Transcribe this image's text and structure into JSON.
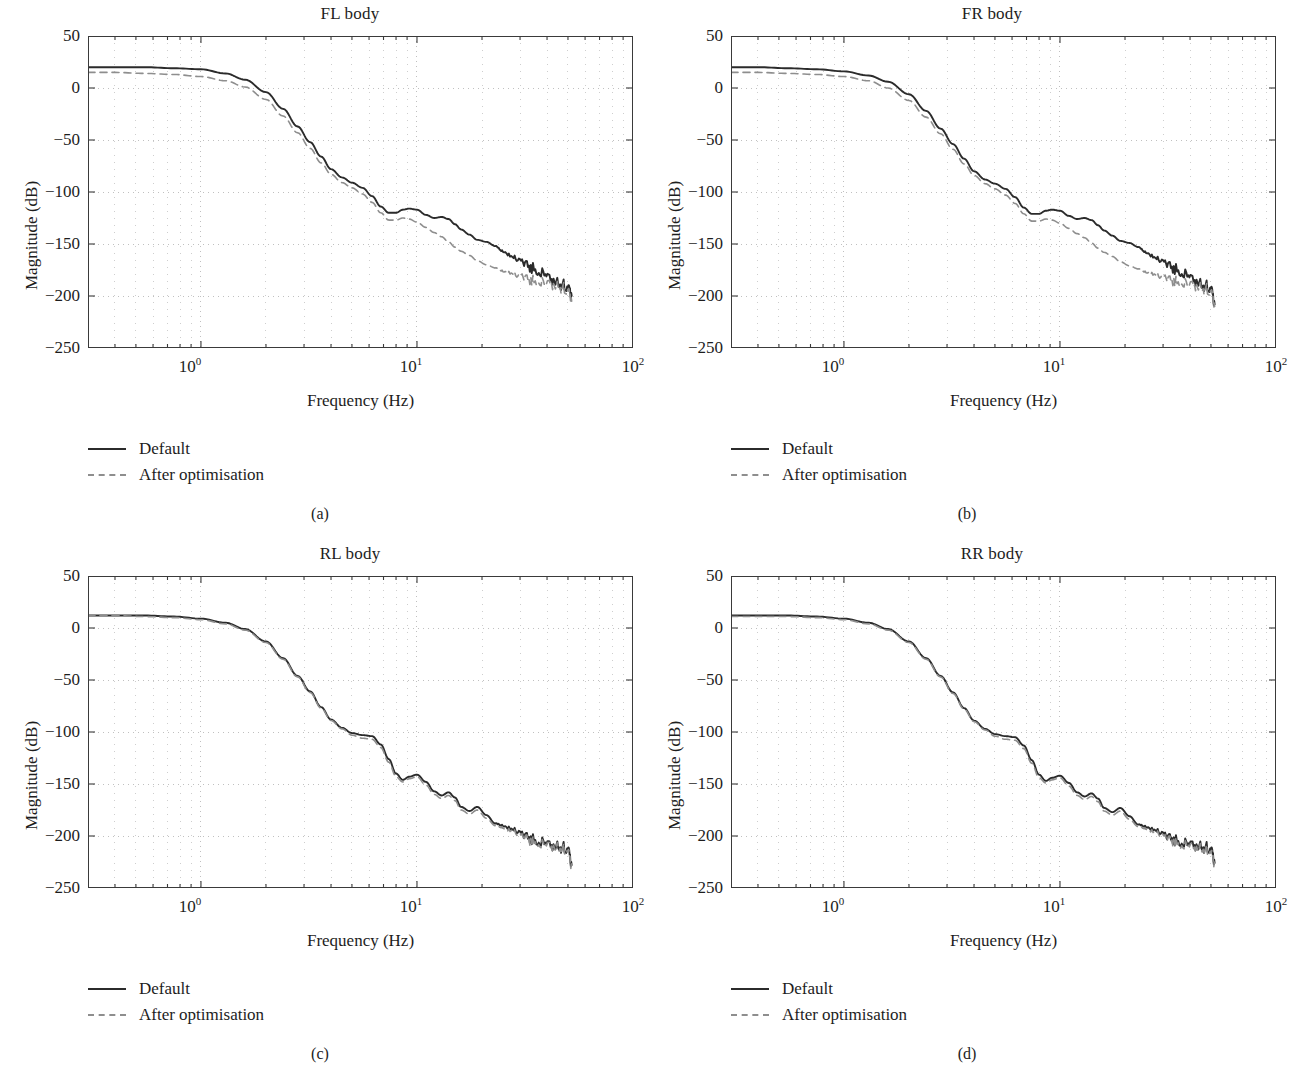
{
  "figure": {
    "panels": [
      {
        "id": "fl",
        "title": "FL body",
        "caption": "(a)",
        "xlabel": "Frequency (Hz)",
        "ylabel": "Magnitude (dB)",
        "legend": [
          {
            "label": "Default",
            "style": "solid"
          },
          {
            "label": "After optimisation",
            "style": "dashed"
          }
        ]
      },
      {
        "id": "fr",
        "title": "FR body",
        "caption": "(b)",
        "xlabel": "Frequency (Hz)",
        "ylabel": "Magnitude (dB)",
        "legend": [
          {
            "label": "Default",
            "style": "solid"
          },
          {
            "label": "After optimisation",
            "style": "dashed"
          }
        ]
      },
      {
        "id": "rl",
        "title": "RL body",
        "caption": "(c)",
        "xlabel": "Frequency (Hz)",
        "ylabel": "Magnitude (dB)",
        "legend": [
          {
            "label": "Default",
            "style": "solid"
          },
          {
            "label": "After optimisation",
            "style": "dashed"
          }
        ]
      },
      {
        "id": "rr",
        "title": "RR body",
        "caption": "(d)",
        "xlabel": "Frequency (Hz)",
        "ylabel": "Magnitude (dB)",
        "legend": [
          {
            "label": "Default",
            "style": "solid"
          },
          {
            "label": "After optimisation",
            "style": "dashed"
          }
        ]
      }
    ],
    "yticks": [
      "50",
      "0",
      "−100",
      "−150",
      "−200",
      "−250",
      "−50"
    ],
    "ytick_labels": [
      "50",
      "0",
      "−50",
      "−100",
      "−150",
      "−200",
      "−250"
    ],
    "xtick_bases": [
      "10",
      "10",
      "10"
    ],
    "xtick_exps": [
      "0",
      "1",
      "2"
    ],
    "colors": {
      "default_line": "#2b2b2b",
      "optimised_line": "#8e8e8e",
      "axis": "#3a3a3a",
      "grid": "#b9b9b9",
      "text": "#1d1d1d"
    }
  },
  "chart_data": [
    {
      "type": "line",
      "title": "FL body",
      "subcaption": "(a)",
      "xlabel": "Frequency (Hz)",
      "ylabel": "Magnitude (dB)",
      "xscale": "log",
      "xlim": [
        0.3,
        100
      ],
      "ylim": [
        -250,
        50
      ],
      "yticks": [
        50,
        0,
        -50,
        -100,
        -150,
        -200,
        -250
      ],
      "xticks": [
        1,
        10,
        100
      ],
      "xtick_labels": [
        "10^0",
        "10^1",
        "10^2"
      ],
      "grid": true,
      "legend": [
        "Default",
        "After optimisation"
      ],
      "legend_position": "below-left",
      "series": [
        {
          "name": "Default",
          "style": "solid",
          "color": "#2b2b2b",
          "x": [
            0.3,
            0.4,
            0.55,
            0.75,
            1.0,
            1.3,
            1.6,
            2.0,
            2.4,
            2.8,
            3.2,
            3.6,
            4.0,
            4.5,
            5.0,
            5.6,
            6.2,
            6.8,
            7.4,
            8.0,
            8.6,
            9.2,
            10.0,
            11.0,
            12.0,
            13.0,
            14.0,
            15.0,
            16.0,
            17.5,
            19.0,
            21.0,
            23.0,
            25.0,
            28.0,
            31.0,
            34.0,
            38.0,
            42.0,
            46.0,
            50.0,
            52.0
          ],
          "y": [
            20,
            20,
            20,
            19,
            18,
            14,
            8,
            -4,
            -20,
            -37,
            -52,
            -66,
            -78,
            -86,
            -91,
            -96,
            -104,
            -114,
            -120,
            -120,
            -117,
            -116,
            -117,
            -122,
            -125,
            -124,
            -126,
            -131,
            -136,
            -141,
            -146,
            -148,
            -152,
            -157,
            -163,
            -168,
            -173,
            -179,
            -185,
            -189,
            -191,
            -200
          ]
        },
        {
          "name": "After optimisation",
          "style": "dashed",
          "color": "#8e8e8e",
          "x": [
            0.3,
            0.4,
            0.55,
            0.75,
            1.0,
            1.3,
            1.6,
            2.0,
            2.4,
            2.8,
            3.2,
            3.6,
            4.0,
            4.5,
            5.0,
            5.6,
            6.2,
            6.8,
            7.4,
            8.0,
            8.6,
            9.2,
            10.0,
            11.0,
            12.0,
            13.0,
            14.0,
            15.0,
            16.0,
            17.5,
            19.0,
            21.0,
            23.0,
            25.0,
            28.0,
            31.0,
            34.0,
            38.0,
            42.0,
            46.0,
            50.0,
            52.0
          ],
          "y": [
            15,
            15,
            14,
            13,
            11,
            7,
            1,
            -11,
            -27,
            -43,
            -58,
            -72,
            -83,
            -91,
            -96,
            -102,
            -110,
            -120,
            -127,
            -127,
            -125,
            -126,
            -129,
            -134,
            -139,
            -143,
            -148,
            -153,
            -157,
            -161,
            -166,
            -170,
            -173,
            -176,
            -179,
            -182,
            -185,
            -188,
            -190,
            -192,
            -194,
            -205
          ]
        }
      ]
    },
    {
      "type": "line",
      "title": "FR body",
      "subcaption": "(b)",
      "xlabel": "Frequency (Hz)",
      "ylabel": "Magnitude (dB)",
      "xscale": "log",
      "xlim": [
        0.3,
        100
      ],
      "ylim": [
        -250,
        50
      ],
      "yticks": [
        50,
        0,
        -50,
        -100,
        -150,
        -200,
        -250
      ],
      "xticks": [
        1,
        10,
        100
      ],
      "xtick_labels": [
        "10^0",
        "10^1",
        "10^2"
      ],
      "grid": true,
      "legend": [
        "Default",
        "After optimisation"
      ],
      "legend_position": "below-left",
      "series": [
        {
          "name": "Default",
          "style": "solid",
          "color": "#2b2b2b",
          "x": [
            0.3,
            0.4,
            0.55,
            0.75,
            1.0,
            1.3,
            1.6,
            2.0,
            2.4,
            2.8,
            3.2,
            3.6,
            4.0,
            4.5,
            5.0,
            5.6,
            6.2,
            6.8,
            7.4,
            8.0,
            8.6,
            9.2,
            10.0,
            11.0,
            12.0,
            13.0,
            14.0,
            15.0,
            16.0,
            17.5,
            19.0,
            21.0,
            23.0,
            25.0,
            28.0,
            31.0,
            34.0,
            38.0,
            42.0,
            46.0,
            50.0,
            52.0
          ],
          "y": [
            20,
            20,
            19,
            18,
            16,
            12,
            6,
            -6,
            -22,
            -39,
            -54,
            -68,
            -80,
            -88,
            -92,
            -97,
            -105,
            -115,
            -121,
            -121,
            -118,
            -117,
            -118,
            -123,
            -126,
            -125,
            -127,
            -132,
            -137,
            -142,
            -147,
            -149,
            -153,
            -158,
            -164,
            -169,
            -174,
            -180,
            -186,
            -190,
            -192,
            -208
          ]
        },
        {
          "name": "After optimisation",
          "style": "dashed",
          "color": "#8e8e8e",
          "x": [
            0.3,
            0.4,
            0.55,
            0.75,
            1.0,
            1.3,
            1.6,
            2.0,
            2.4,
            2.8,
            3.2,
            3.6,
            4.0,
            4.5,
            5.0,
            5.6,
            6.2,
            6.8,
            7.4,
            8.0,
            8.6,
            9.2,
            10.0,
            11.0,
            12.0,
            13.0,
            14.0,
            15.0,
            16.0,
            17.5,
            19.0,
            21.0,
            23.0,
            25.0,
            28.0,
            31.0,
            34.0,
            38.0,
            42.0,
            46.0,
            50.0,
            52.0
          ],
          "y": [
            15,
            15,
            14,
            13,
            11,
            7,
            0,
            -12,
            -28,
            -44,
            -59,
            -73,
            -84,
            -92,
            -97,
            -103,
            -111,
            -121,
            -128,
            -128,
            -126,
            -127,
            -130,
            -135,
            -140,
            -144,
            -149,
            -154,
            -158,
            -162,
            -167,
            -171,
            -174,
            -177,
            -180,
            -183,
            -186,
            -189,
            -191,
            -193,
            -195,
            -210
          ]
        }
      ]
    },
    {
      "type": "line",
      "title": "RL body",
      "subcaption": "(c)",
      "xlabel": "Frequency (Hz)",
      "ylabel": "Magnitude (dB)",
      "xscale": "log",
      "xlim": [
        0.3,
        100
      ],
      "ylim": [
        -250,
        50
      ],
      "yticks": [
        50,
        0,
        -50,
        -100,
        -150,
        -200,
        -250
      ],
      "xticks": [
        1,
        10,
        100
      ],
      "xtick_labels": [
        "10^0",
        "10^1",
        "10^2"
      ],
      "grid": true,
      "legend": [
        "Default",
        "After optimisation"
      ],
      "legend_position": "below-left",
      "series": [
        {
          "name": "Default",
          "style": "solid",
          "color": "#2b2b2b",
          "x": [
            0.3,
            0.4,
            0.55,
            0.75,
            1.0,
            1.3,
            1.6,
            2.0,
            2.4,
            2.8,
            3.2,
            3.6,
            4.0,
            4.5,
            5.0,
            5.6,
            6.2,
            6.8,
            7.4,
            8.0,
            8.6,
            9.2,
            10.0,
            11.0,
            12.0,
            13.0,
            14.0,
            15.0,
            16.0,
            17.5,
            19.0,
            21.0,
            23.0,
            25.0,
            28.0,
            31.0,
            34.0,
            38.0,
            42.0,
            46.0,
            50.0,
            52.0
          ],
          "y": [
            12,
            12,
            12,
            11,
            9,
            5,
            -1,
            -13,
            -29,
            -46,
            -61,
            -76,
            -88,
            -96,
            -101,
            -103,
            -104,
            -112,
            -126,
            -140,
            -146,
            -143,
            -141,
            -148,
            -157,
            -161,
            -158,
            -163,
            -172,
            -176,
            -172,
            -180,
            -188,
            -190,
            -194,
            -199,
            -203,
            -207,
            -210,
            -211,
            -212,
            -228
          ]
        },
        {
          "name": "After optimisation",
          "style": "dashed",
          "color": "#8e8e8e",
          "x": [
            0.3,
            0.4,
            0.55,
            0.75,
            1.0,
            1.3,
            1.6,
            2.0,
            2.4,
            2.8,
            3.2,
            3.6,
            4.0,
            4.5,
            5.0,
            5.6,
            6.2,
            6.8,
            7.4,
            8.0,
            8.6,
            9.2,
            10.0,
            11.0,
            12.0,
            13.0,
            14.0,
            15.0,
            16.0,
            17.5,
            19.0,
            21.0,
            23.0,
            25.0,
            28.0,
            31.0,
            34.0,
            38.0,
            42.0,
            46.0,
            50.0,
            52.0
          ],
          "y": [
            12,
            12,
            11,
            10,
            8,
            4,
            -2,
            -14,
            -30,
            -47,
            -62,
            -77,
            -89,
            -97,
            -103,
            -106,
            -107,
            -115,
            -129,
            -143,
            -148,
            -145,
            -143,
            -151,
            -160,
            -164,
            -161,
            -166,
            -175,
            -179,
            -175,
            -183,
            -190,
            -192,
            -196,
            -201,
            -205,
            -209,
            -211,
            -212,
            -214,
            -230
          ]
        }
      ]
    },
    {
      "type": "line",
      "title": "RR body",
      "subcaption": "(d)",
      "xlabel": "Frequency (Hz)",
      "ylabel": "Magnitude (dB)",
      "xscale": "log",
      "xlim": [
        0.3,
        100
      ],
      "ylim": [
        -250,
        50
      ],
      "yticks": [
        50,
        0,
        -50,
        -100,
        -150,
        -200,
        -250
      ],
      "xticks": [
        1,
        10,
        100
      ],
      "xtick_labels": [
        "10^0",
        "10^1",
        "10^2"
      ],
      "grid": true,
      "legend": [
        "Default",
        "After optimisation"
      ],
      "legend_position": "below-left",
      "series": [
        {
          "name": "Default",
          "style": "solid",
          "color": "#2b2b2b",
          "x": [
            0.3,
            0.4,
            0.55,
            0.75,
            1.0,
            1.3,
            1.6,
            2.0,
            2.4,
            2.8,
            3.2,
            3.6,
            4.0,
            4.5,
            5.0,
            5.6,
            6.2,
            6.8,
            7.4,
            8.0,
            8.6,
            9.2,
            10.0,
            11.0,
            12.0,
            13.0,
            14.0,
            15.0,
            16.0,
            17.5,
            19.0,
            21.0,
            23.0,
            25.0,
            28.0,
            31.0,
            34.0,
            38.0,
            42.0,
            46.0,
            50.0,
            52.0
          ],
          "y": [
            12,
            12,
            12,
            11,
            9,
            5,
            -1,
            -13,
            -29,
            -46,
            -62,
            -77,
            -89,
            -97,
            -102,
            -104,
            -105,
            -113,
            -127,
            -141,
            -147,
            -144,
            -142,
            -149,
            -158,
            -162,
            -159,
            -164,
            -173,
            -177,
            -173,
            -181,
            -189,
            -191,
            -195,
            -200,
            -204,
            -208,
            -210,
            -211,
            -212,
            -226
          ]
        },
        {
          "name": "After optimisation",
          "style": "dashed",
          "color": "#8e8e8e",
          "x": [
            0.3,
            0.4,
            0.55,
            0.75,
            1.0,
            1.3,
            1.6,
            2.0,
            2.4,
            2.8,
            3.2,
            3.6,
            4.0,
            4.5,
            5.0,
            5.6,
            6.2,
            6.8,
            7.4,
            8.0,
            8.6,
            9.2,
            10.0,
            11.0,
            12.0,
            13.0,
            14.0,
            15.0,
            16.0,
            17.5,
            19.0,
            21.0,
            23.0,
            25.0,
            28.0,
            31.0,
            34.0,
            38.0,
            42.0,
            46.0,
            50.0,
            52.0
          ],
          "y": [
            11,
            11,
            11,
            10,
            8,
            4,
            -2,
            -14,
            -30,
            -47,
            -63,
            -78,
            -90,
            -98,
            -104,
            -107,
            -108,
            -116,
            -130,
            -144,
            -149,
            -146,
            -144,
            -152,
            -161,
            -165,
            -162,
            -167,
            -176,
            -180,
            -176,
            -184,
            -191,
            -193,
            -197,
            -202,
            -206,
            -210,
            -212,
            -213,
            -215,
            -228
          ]
        }
      ]
    }
  ]
}
